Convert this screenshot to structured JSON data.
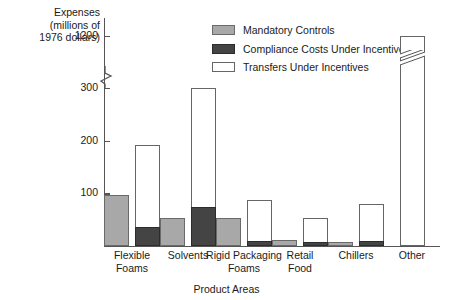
{
  "chart_data": {
    "type": "bar",
    "title": "",
    "ylabel": "Expenses\n(millions of\n1976 dollars)",
    "ylabel_lines": [
      "Expenses",
      "(millions of",
      "1976 dollars)"
    ],
    "xlabel": "Product Areas",
    "categories": [
      "Flexible Foams",
      "Solvents",
      "Rigid Packaging Foams",
      "Retail Food",
      "Chillers",
      "Other"
    ],
    "category_lines": [
      [
        "Flexible",
        "Foams"
      ],
      [
        "Solvents"
      ],
      [
        "Rigid Packaging",
        "Foams"
      ],
      [
        "Retail",
        "Food"
      ],
      [
        "Chillers"
      ],
      [
        "Other"
      ]
    ],
    "yticks": [
      100,
      200,
      300,
      1200
    ],
    "ytick_labels": [
      "100",
      "200",
      "300",
      "1200"
    ],
    "ylim": [
      0,
      1200
    ],
    "axis_break": {
      "between": [
        300,
        1200
      ],
      "present": true
    },
    "grid": false,
    "legend_position": "top-center",
    "series": [
      {
        "name": "Mandatory Controls",
        "color": "#a8a8a8",
        "values": [
          97,
          53,
          53,
          12,
          8,
          0
        ]
      },
      {
        "name": "Compliance Costs Under Incentives",
        "color": "#444444",
        "values": [
          37,
          74,
          10,
          8,
          10,
          0
        ]
      },
      {
        "name": "Transfers Under Incentives",
        "color": "#ffffff",
        "values": [
          155,
          226,
          78,
          45,
          70,
          1200
        ]
      }
    ],
    "stacked_totals": [
      192,
      300,
      88,
      53,
      80,
      1200
    ],
    "annotations": [
      {
        "text": "axis break on y-axis between 300 and 1200",
        "type": "break"
      },
      {
        "text": "break mark on Other bar indicating truncated value",
        "type": "bar-break",
        "category": "Other"
      }
    ]
  },
  "legend": {
    "items": [
      {
        "label": "Mandatory Controls",
        "swatch": "mandatory-swatch"
      },
      {
        "label": "Compliance Costs Under Incentives",
        "swatch": "compliance-swatch"
      },
      {
        "label": "Transfers Under Incentives",
        "swatch": "transfers-swatch"
      }
    ]
  }
}
